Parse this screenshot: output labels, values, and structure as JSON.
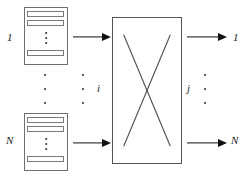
{
  "diagram": {
    "colors": {
      "line": "#555555",
      "queue_border": "#6f6f6f",
      "bar_border": "#7a7a7a",
      "arrow": "#111111",
      "text": "#1a1a1a",
      "background": "#ffffff"
    },
    "inputs": [
      {
        "id": "input-1",
        "label": "1",
        "queue_bars": 3,
        "queue_ellipsis": "vertical"
      },
      {
        "id": "input-N",
        "label": "N",
        "queue_bars": 3,
        "queue_ellipsis": "vertical"
      }
    ],
    "outputs": [
      {
        "id": "output-1",
        "label": "1"
      },
      {
        "id": "output-N",
        "label": "N"
      }
    ],
    "input_ellipsis_dots": 3,
    "input_index_label": "i",
    "output_index_label": "j",
    "input_index_dots": 3,
    "output_index_dots": 3,
    "fabric": {
      "id": "switch-fabric",
      "crossing_lines": 2
    },
    "arrows": {
      "in_top": "arrow-input-1-to-fabric",
      "in_bottom": "arrow-input-N-to-fabric",
      "out_top": "arrow-fabric-to-output-1",
      "out_bottom": "arrow-fabric-to-output-N"
    }
  }
}
